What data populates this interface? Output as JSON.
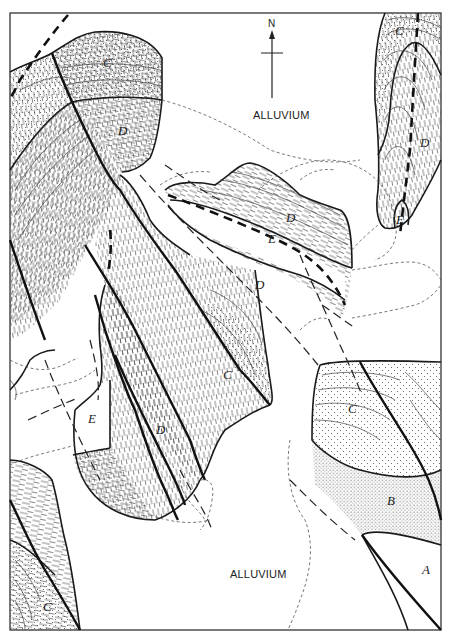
{
  "figure": {
    "type": "geologic map",
    "header_text": "",
    "north_arrow": {
      "label": "N"
    },
    "alluvium_labels": [
      "ALLUVIUM",
      "ALLUVIUM"
    ],
    "units": {
      "A": "A",
      "B": "B",
      "C": "C",
      "D": "D",
      "E": "E"
    },
    "unit_labels": [
      {
        "id": "c-top-left",
        "text": "C"
      },
      {
        "id": "d-top-left",
        "text": "D"
      },
      {
        "id": "c-top-right",
        "text": "C"
      },
      {
        "id": "d-top-right",
        "text": "D"
      },
      {
        "id": "e-top-right",
        "text": "E"
      },
      {
        "id": "d-center-upper",
        "text": "D"
      },
      {
        "id": "e-center",
        "text": "E"
      },
      {
        "id": "d-center-lower",
        "text": "D"
      },
      {
        "id": "c-center",
        "text": "C"
      },
      {
        "id": "d-left-center",
        "text": "D"
      },
      {
        "id": "e-left-center",
        "text": "E"
      },
      {
        "id": "c-right",
        "text": "C"
      },
      {
        "id": "b-right",
        "text": "B"
      },
      {
        "id": "a-bottom-right",
        "text": "A"
      },
      {
        "id": "c-bottom-left",
        "text": "C"
      }
    ]
  }
}
